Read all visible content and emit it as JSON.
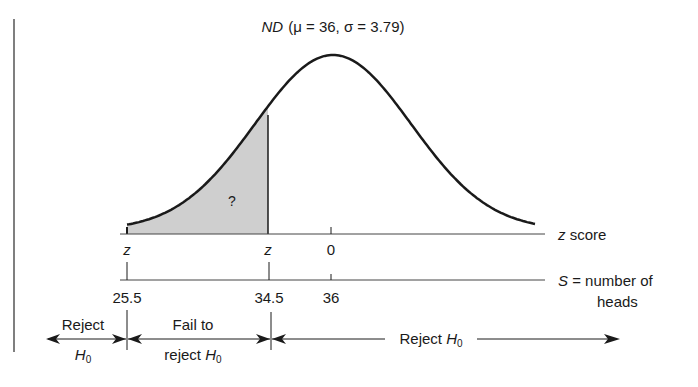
{
  "title": {
    "prefix": "ND",
    "params": "(μ = 36, σ = 3.79)"
  },
  "curve": {
    "mean": 36,
    "sd": 3.79,
    "shaded_region_label": "?",
    "shaded_from": 25.5,
    "shaded_to": 34.5
  },
  "z_axis": {
    "label": "z score",
    "ticks": [
      {
        "label": "z",
        "italic": true
      },
      {
        "label": "z",
        "italic": true
      },
      {
        "label": "0",
        "italic": false
      }
    ]
  },
  "s_axis": {
    "label_var": "S",
    "label_eq": " = number of",
    "label_line2": "heads",
    "ticks": [
      "25.5",
      "34.5",
      "36"
    ]
  },
  "regions": {
    "left": {
      "line1": "Reject",
      "line2": "H",
      "sub": "0"
    },
    "middle": {
      "line1": "Fail to",
      "line2": "reject ",
      "line2_var": "H",
      "sub": "0"
    },
    "right": {
      "label": "Reject ",
      "var": "H",
      "sub": "0"
    }
  },
  "colors": {
    "ink": "#1a1a1a",
    "shade": "#cfcfcf",
    "frame": "#555555"
  }
}
